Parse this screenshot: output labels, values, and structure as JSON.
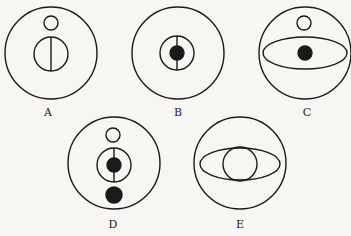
{
  "figure": {
    "stroke_color": "#1a1a1a",
    "background": "#f7f6f3",
    "panels": [
      {
        "label": "A",
        "description": "outer circle with small open circle above an inner circle bisected by a vertical line"
      },
      {
        "label": "B",
        "description": "outer circle with inner circle containing a filled dot and vertical line"
      },
      {
        "label": "C",
        "description": "outer circle with small open circle above a horizontal ellipse containing a filled dot"
      },
      {
        "label": "D",
        "description": "outer circle with small open circle, inner circle with filled dot and vertical line, and a filled dot below"
      },
      {
        "label": "E",
        "description": "outer circle with horizontal ellipse overlapping an inner circle"
      }
    ]
  }
}
